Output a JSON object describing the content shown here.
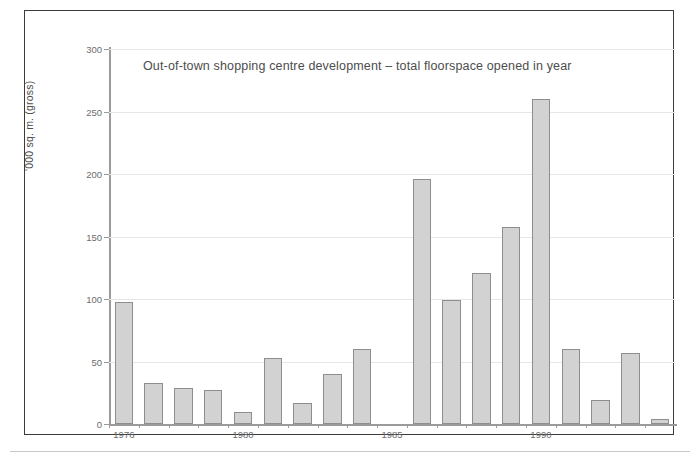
{
  "figure": {
    "title": "Out-of-town shopping centre development – total floorspace opened in year"
  },
  "chart_data": {
    "type": "bar",
    "title": "Out-of-town shopping centre development – total floorspace opened in year",
    "xlabel": "",
    "ylabel": "'000 sq. m. (gross)",
    "ylim": [
      0,
      300
    ],
    "y_ticks": [
      0,
      50,
      100,
      150,
      200,
      250,
      300
    ],
    "y_tick_labels": [
      "0",
      "50",
      "100",
      "150",
      "200",
      "250",
      "300"
    ],
    "grid": true,
    "legend": "none",
    "categories": [
      "1976",
      "1977",
      "1978",
      "1979",
      "1980",
      "1981",
      "1982",
      "1983",
      "1984",
      "1985",
      "1986",
      "1987",
      "1988",
      "1989",
      "1990",
      "1991",
      "1992",
      "1993",
      "1994"
    ],
    "x_tick_labels": [
      "1976",
      "1980",
      "1985",
      "1990"
    ],
    "x_tick_categories": [
      "1976",
      "1980",
      "1985",
      "1990"
    ],
    "values": [
      98,
      33,
      29,
      27,
      10,
      53,
      17,
      40,
      60,
      0,
      196,
      99,
      121,
      158,
      260,
      60,
      19,
      57,
      4
    ],
    "bar_fill": "#d2d2d2",
    "bar_edge": "#8e8e8e"
  }
}
